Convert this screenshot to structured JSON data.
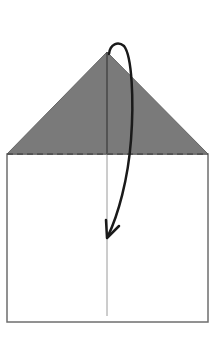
{
  "diagram": {
    "type": "origami-fold-step",
    "colors": {
      "background": "#ffffff",
      "flap_fill": "#7a7a7a",
      "outline": "#6e6e6e",
      "crease": "#9a9a9a",
      "dashed_fold_line": "#555555",
      "arrow": "#1a1a1a"
    },
    "geometry": {
      "apex": [
        107,
        52
      ],
      "base_left": [
        7,
        154
      ],
      "base_right": [
        208,
        154
      ],
      "rect_bottom": 322,
      "crease_x": 107,
      "crease_bottom": 316,
      "arrow_tip": [
        107,
        238
      ]
    },
    "elements": {
      "flap": "triangular flap (shaded)",
      "fold_line": "valley fold (dashed)",
      "center_crease": "vertical center crease",
      "arrow": "fold-down arrow"
    }
  }
}
